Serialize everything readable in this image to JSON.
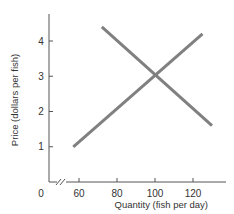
{
  "chart_data": {
    "type": "line",
    "title": "",
    "xlabel": "Quantity (fish per day)",
    "ylabel": "Price (dollars per fish)",
    "x_ticks": [
      0,
      60,
      80,
      100,
      120
    ],
    "y_ticks": [
      1,
      2,
      3,
      4
    ],
    "x_axis_break": true,
    "xlim": [
      50,
      135
    ],
    "ylim": [
      0,
      4.8
    ],
    "grid": false,
    "legend": null,
    "series": [
      {
        "name": "Supply",
        "x": [
          57,
          125
        ],
        "y": [
          1.0,
          4.2
        ],
        "color": "#808080"
      },
      {
        "name": "Demand",
        "x": [
          72,
          130
        ],
        "y": [
          4.4,
          1.6
        ],
        "color": "#808080"
      }
    ],
    "equilibrium": {
      "x": 100,
      "y": 3
    }
  },
  "axis": {
    "x_title": "Quantity (fish per day)",
    "y_title": "Price (dollars per fish)",
    "origin_label": "0",
    "x_tick_labels": [
      "60",
      "80",
      "100",
      "120"
    ],
    "y_tick_labels": [
      "1",
      "2",
      "3",
      "4"
    ]
  },
  "colors": {
    "axis": "#555555",
    "line": "#808080",
    "text": "#333333"
  }
}
